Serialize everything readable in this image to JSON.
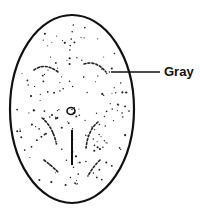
{
  "diagram": {
    "labels": [
      {
        "text": "Gray",
        "points_to": "dark mottled patch"
      }
    ]
  },
  "colors": {
    "ink": "#111111",
    "background": "#ffffff"
  }
}
